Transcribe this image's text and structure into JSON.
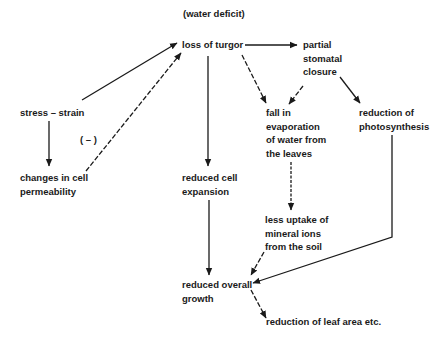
{
  "diagram": {
    "title": "(water deficit)",
    "nodes": {
      "loss_of_turgor": "loss of turgor",
      "partial_stomatal_closure": [
        "partial",
        "stomatal",
        "closure"
      ],
      "stress_strain": "stress – strain",
      "negative_sign": "( – )",
      "changes_in_cell_permeability": [
        "changes in cell",
        "permeability"
      ],
      "reduced_cell_expansion": [
        "reduced cell",
        "expansion"
      ],
      "fall_in_evaporation": [
        "fall in",
        "evaporation",
        "of water from",
        "the leaves"
      ],
      "reduction_of_photosynthesis": [
        "reduction of",
        "photosynthesis"
      ],
      "less_uptake_of_mineral_ions": [
        "less uptake of",
        "mineral ions",
        "from the soil"
      ],
      "reduced_overall_growth": [
        "reduced overall",
        "growth"
      ],
      "reduction_of_leaf_area": "reduction of leaf area etc."
    },
    "edges": [
      {
        "from": "stress_strain",
        "to": "loss_of_turgor",
        "style": "solid"
      },
      {
        "from": "stress_strain",
        "to": "changes_in_cell_permeability",
        "style": "solid"
      },
      {
        "from": "changes_in_cell_permeability",
        "to": "loss_of_turgor",
        "style": "dashed",
        "label": "( – )"
      },
      {
        "from": "loss_of_turgor",
        "to": "partial_stomatal_closure",
        "style": "solid"
      },
      {
        "from": "loss_of_turgor",
        "to": "reduced_cell_expansion",
        "style": "solid"
      },
      {
        "from": "loss_of_turgor",
        "to": "fall_in_evaporation",
        "style": "dashed"
      },
      {
        "from": "partial_stomatal_closure",
        "to": "fall_in_evaporation",
        "style": "dashed"
      },
      {
        "from": "partial_stomatal_closure",
        "to": "reduction_of_photosynthesis",
        "style": "solid"
      },
      {
        "from": "fall_in_evaporation",
        "to": "less_uptake_of_mineral_ions",
        "style": "dashed"
      },
      {
        "from": "reduced_cell_expansion",
        "to": "reduced_overall_growth",
        "style": "solid"
      },
      {
        "from": "less_uptake_of_mineral_ions",
        "to": "reduced_overall_growth",
        "style": "dashed"
      },
      {
        "from": "reduction_of_photosynthesis",
        "to": "reduced_overall_growth",
        "style": "solid"
      },
      {
        "from": "reduced_overall_growth",
        "to": "reduction_of_leaf_area",
        "style": "dashed"
      }
    ],
    "colors": {
      "ink": "#1a1a1a",
      "background": "#ffffff"
    }
  }
}
